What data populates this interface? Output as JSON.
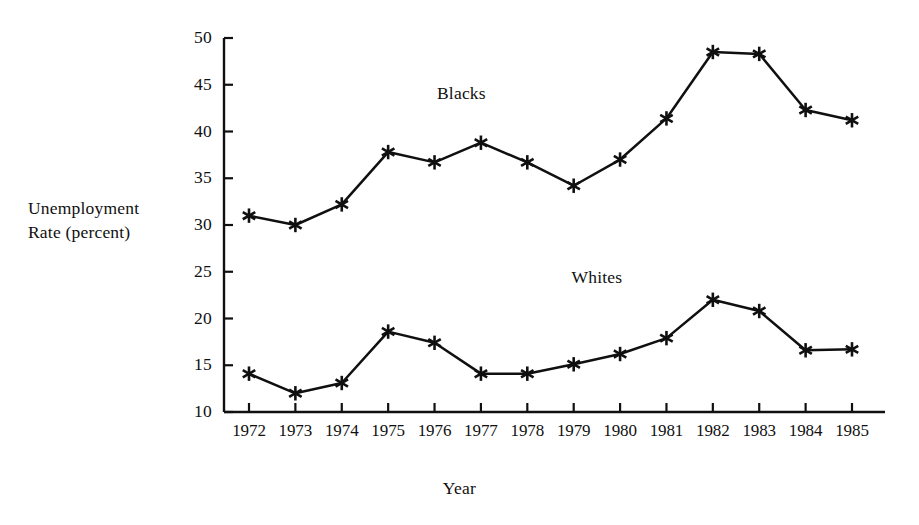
{
  "chart_data": {
    "type": "line",
    "title": "",
    "xlabel": "Year",
    "ylabel": "Unemployment\nRate (percent)",
    "categories": [
      "1972",
      "1973",
      "1974",
      "1975",
      "1976",
      "1977",
      "1978",
      "1979",
      "1980",
      "1981",
      "1982",
      "1983",
      "1984",
      "1985"
    ],
    "x": [
      1972,
      1973,
      1974,
      1975,
      1976,
      1977,
      1978,
      1979,
      1980,
      1981,
      1982,
      1983,
      1984,
      1985
    ],
    "series": [
      {
        "name": "Blacks",
        "label": "Blacks",
        "values": [
          31.0,
          30.0,
          32.2,
          37.8,
          36.7,
          38.8,
          36.7,
          34.2,
          37.0,
          41.4,
          48.5,
          48.3,
          42.3,
          41.2
        ],
        "color": "#101010",
        "marker": "asterisk"
      },
      {
        "name": "Whites",
        "label": "Whites",
        "values": [
          14.1,
          12.0,
          13.1,
          18.6,
          17.4,
          14.1,
          14.1,
          15.1,
          16.2,
          17.9,
          22.0,
          20.8,
          16.6,
          16.7
        ],
        "color": "#101010",
        "marker": "asterisk"
      }
    ],
    "ylim": [
      10,
      50
    ],
    "yticks": [
      10,
      15,
      20,
      25,
      30,
      35,
      40,
      45,
      50
    ],
    "ytick_labels": [
      "10",
      "15",
      "20",
      "25",
      "30",
      "35",
      "40",
      "45",
      "50"
    ],
    "xlim": [
      1972,
      1985
    ],
    "grid": false,
    "legend_position": "inline-annotation",
    "annotations": [
      {
        "text": "Blacks",
        "series": "Blacks",
        "x": 1976.7,
        "y": 44.0
      },
      {
        "text": "Whites",
        "series": "Whites",
        "x": 1979.6,
        "y": 24.3
      }
    ]
  },
  "axis": {
    "y_title_line1": "Unemployment",
    "y_title_line2": "Rate (percent)",
    "y_title": "Unemployment\nRate (percent)",
    "x_title": "Year"
  },
  "colors": {
    "line": "#101010",
    "axis": "#101010",
    "background": "#ffffff",
    "text": "#101010"
  }
}
